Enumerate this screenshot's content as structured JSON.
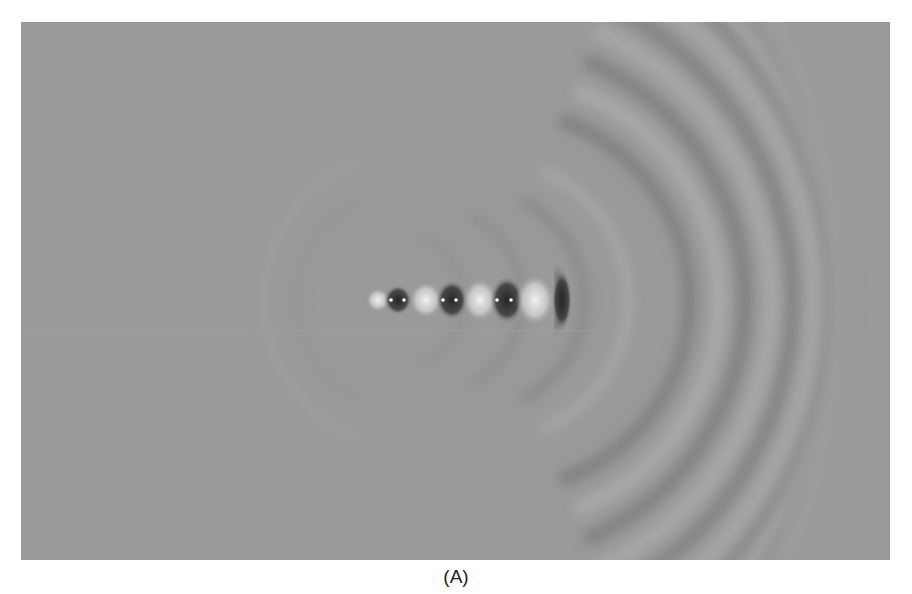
{
  "figure": {
    "caption": "(A)",
    "colors": {
      "background": "#9a9a9a",
      "dark_band": "#4a4a4a",
      "light_band": "#cfcfcf",
      "source_dot": "#ffffff"
    },
    "sources": [
      {
        "x": 378,
        "y": 300,
        "type": "bright"
      },
      {
        "x": 398,
        "y": 300,
        "type": "dark-pair"
      },
      {
        "x": 450,
        "y": 300,
        "type": "dark-pair"
      },
      {
        "x": 505,
        "y": 300,
        "type": "dark-pair"
      },
      {
        "x": 560,
        "y": 300,
        "type": "dark-crest"
      }
    ]
  }
}
